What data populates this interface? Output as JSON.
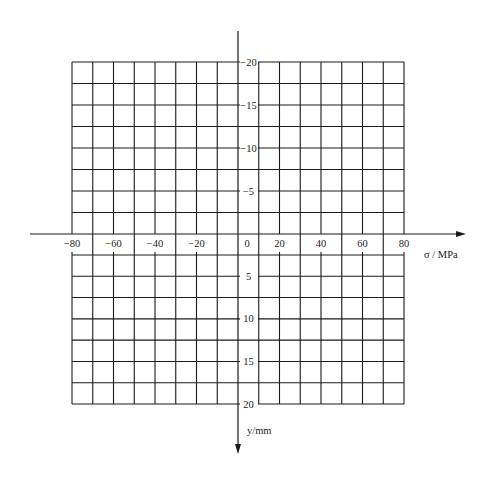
{
  "diagram": {
    "type": "blank stress-distribution grid",
    "horizontal_axis": {
      "title": "σ / MPa",
      "ticks": [
        {
          "value": -80,
          "label": "−80"
        },
        {
          "value": -60,
          "label": "−60"
        },
        {
          "value": -40,
          "label": "−40"
        },
        {
          "value": -20,
          "label": "−20"
        },
        {
          "value": 0,
          "label": "0"
        },
        {
          "value": 20,
          "label": "20"
        },
        {
          "value": 40,
          "label": "40"
        },
        {
          "value": 60,
          "label": "60"
        },
        {
          "value": 80,
          "label": "80"
        }
      ],
      "range": [
        -80,
        80
      ],
      "minor_step": 10,
      "arrow": "right"
    },
    "vertical_axis": {
      "title": "y/mm",
      "ticks": [
        {
          "value": -20,
          "label": "−20"
        },
        {
          "value": -15,
          "label": "−15"
        },
        {
          "value": -10,
          "label": "−10"
        },
        {
          "value": -5,
          "label": "−5"
        },
        {
          "value": 5,
          "label": "5"
        },
        {
          "value": 10,
          "label": "10"
        },
        {
          "value": 15,
          "label": "15"
        },
        {
          "value": 20,
          "label": "20"
        }
      ],
      "range": [
        -20,
        20
      ],
      "minor_step": 2.5,
      "arrow": "down"
    },
    "grid": {
      "columns": 16,
      "rows_above_axis": 8,
      "rows_below_axis": 7
    },
    "line_color": "#1a1a1a"
  }
}
